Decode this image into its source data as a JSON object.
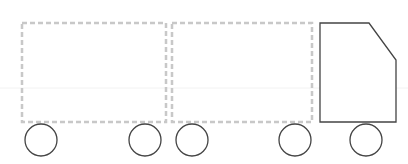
{
  "diagram": {
    "type": "truck-with-trailers",
    "colors": {
      "background": "#ffffff",
      "trailer_dash": "#c8c8c8",
      "outline": "#444444",
      "faint_line": "#f0f0f0"
    },
    "trailers": [
      {
        "x": 22,
        "y": 23,
        "w": 144,
        "h": 99
      },
      {
        "x": 172,
        "y": 23,
        "w": 140,
        "h": 99
      }
    ],
    "cab": {
      "points": "320,23 369,23 396,60 396,122 320,122"
    },
    "wheels": [
      {
        "cx": 41,
        "cy": 140,
        "r": 16
      },
      {
        "cx": 145,
        "cy": 140,
        "r": 16
      },
      {
        "cx": 192,
        "cy": 140,
        "r": 16
      },
      {
        "cx": 295,
        "cy": 140,
        "r": 16
      },
      {
        "cx": 366,
        "cy": 140,
        "r": 16
      }
    ]
  }
}
